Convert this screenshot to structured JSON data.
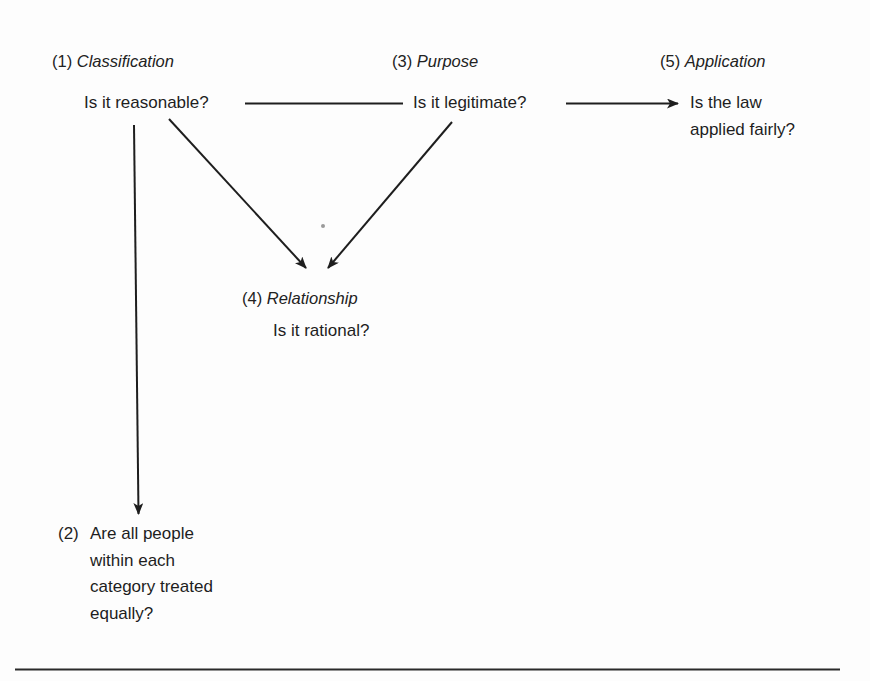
{
  "diagram": {
    "type": "flow",
    "nodes": [
      {
        "id": "classification",
        "number": "(1)",
        "title": "Classification",
        "question": "Is it reasonable?"
      },
      {
        "id": "equal-treatment",
        "number": "(2)",
        "question_lines": [
          "Are all people",
          "within each",
          "category treated",
          "equally?"
        ]
      },
      {
        "id": "purpose",
        "number": "(3)",
        "title": "Purpose",
        "question": "Is it legitimate?"
      },
      {
        "id": "relationship",
        "number": "(4)",
        "title": "Relationship",
        "question": "Is it rational?"
      },
      {
        "id": "application",
        "number": "(5)",
        "title": "Application",
        "question_lines": [
          "Is the law",
          "applied fairly?"
        ]
      }
    ],
    "edges": [
      {
        "from": "classification",
        "to": "purpose",
        "style": "line",
        "arrow": false
      },
      {
        "from": "purpose",
        "to": "application",
        "style": "arrow",
        "arrow": true
      },
      {
        "from": "classification",
        "to": "relationship",
        "style": "arrow",
        "arrow": true
      },
      {
        "from": "purpose",
        "to": "relationship",
        "style": "arrow",
        "arrow": true
      },
      {
        "from": "classification",
        "to": "equal-treatment",
        "style": "arrow",
        "arrow": true
      }
    ],
    "colors": {
      "ink": "#1e1e1e",
      "background": "#fdfdfd"
    }
  }
}
